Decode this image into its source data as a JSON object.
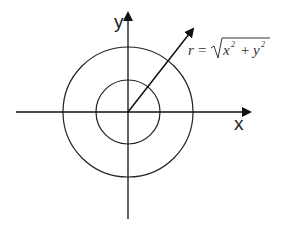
{
  "diagram": {
    "axes": {
      "x_label": "x",
      "y_label": "y"
    },
    "circles": [
      {
        "name": "inner",
        "radius_px": 32
      },
      {
        "name": "outer",
        "radius_px": 65
      }
    ],
    "radius_vector": {
      "label_r": "r",
      "equals": "=",
      "x": "x",
      "y": "y",
      "exp": "2",
      "plus": "+"
    },
    "stroke_color": "#222222",
    "background": "#ffffff"
  }
}
